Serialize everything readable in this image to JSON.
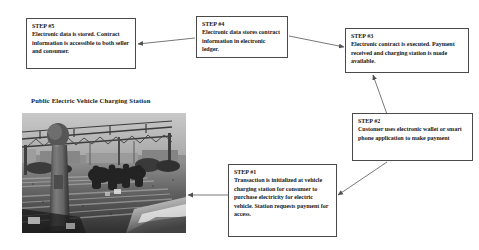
{
  "diagram": {
    "title_caption": "Public Electric Vehicle Charging Station",
    "boxes": [
      {
        "id": "step5",
        "label": "STEP #5",
        "text": "Electronic data is stored. Contract information is accessible to both seller and consumer."
      },
      {
        "id": "step4",
        "label": "STEP #4",
        "text": "Electronic data stores contract information in electronic ledger."
      },
      {
        "id": "step3",
        "label": "STEP #3",
        "text": "Electronic contract is executed. Payment received and charging station is made available."
      },
      {
        "id": "step2",
        "label": "STEP #2",
        "text": "Customer uses electronic wallet or smart phone application to make payment"
      },
      {
        "id": "step1",
        "label": "STEP #1",
        "text": "Transaction is initialized at vehicle charging station for consumer to purchase electricity for electric vehicle.  Station requests payment for access."
      }
    ],
    "connectors": [
      {
        "from": "step1",
        "to": "photo",
        "style": "arrow-left"
      },
      {
        "from": "step2",
        "to": "step1",
        "style": "arrow-diagonal"
      },
      {
        "from": "step3",
        "to": "step2",
        "style": "arrow-vertical"
      },
      {
        "from": "step4",
        "to": "step3",
        "style": "arrow-diagonal"
      },
      {
        "from": "step4",
        "to": "step5",
        "style": "arrow-left"
      }
    ],
    "colors": {
      "box_border": "#4a4a4a",
      "box_fill": "#ffffff",
      "text": "#1a1a1a",
      "connector": "#555555",
      "page_background": "#ffffff"
    },
    "photo": {
      "alt": "Grayscale photograph of a public electric vehicle charging station with a charging post in the foreground, overhead steel truss canopy, parked cars and people in the background"
    }
  }
}
